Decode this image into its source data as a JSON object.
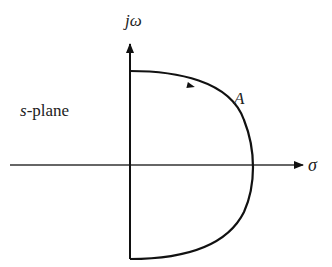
{
  "diagram": {
    "type": "s-plane contour (Nyquist contour, right half-plane)",
    "labels": {
      "vertical_axis": "jω",
      "horizontal_axis": "σ",
      "region": "-plane",
      "region_italic_prefix": "s",
      "contour": "A"
    },
    "colors": {
      "stroke": "#111111",
      "background": "#ffffff",
      "text": "#222222"
    }
  }
}
